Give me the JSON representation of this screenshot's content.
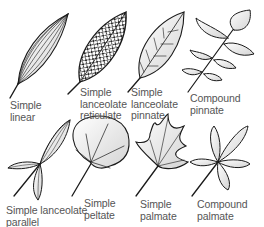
{
  "diagram": {
    "colors": {
      "outline": "#1a1a1a",
      "fill_light": "#f2f2f2",
      "fill_mid": "#d9d9d9",
      "label": "#555555"
    },
    "leaves": [
      {
        "id": "simple-linear",
        "line1": "Simple",
        "line2": "linear",
        "line3": ""
      },
      {
        "id": "simple-lanceolate-reticulate",
        "line1": "Simple",
        "line2": "lanceolate",
        "line3": "reticulate"
      },
      {
        "id": "simple-lanceolate-pinnate",
        "line1": "Simple",
        "line2": "lanceolate",
        "line3": "pinnate"
      },
      {
        "id": "compound-pinnate",
        "line1": "Compound",
        "line2": "pinnate",
        "line3": ""
      },
      {
        "id": "simple-lanceolate-parallel",
        "line1": "Simple lanceolate",
        "line2": "parallel",
        "line3": ""
      },
      {
        "id": "simple-peltate",
        "line1": "Simple",
        "line2": "peltate",
        "line3": ""
      },
      {
        "id": "simple-palmate",
        "line1": "Simple",
        "line2": "palmate",
        "line3": ""
      },
      {
        "id": "compound-palmate",
        "line1": "Compound",
        "line2": "palmate",
        "line3": ""
      }
    ]
  }
}
